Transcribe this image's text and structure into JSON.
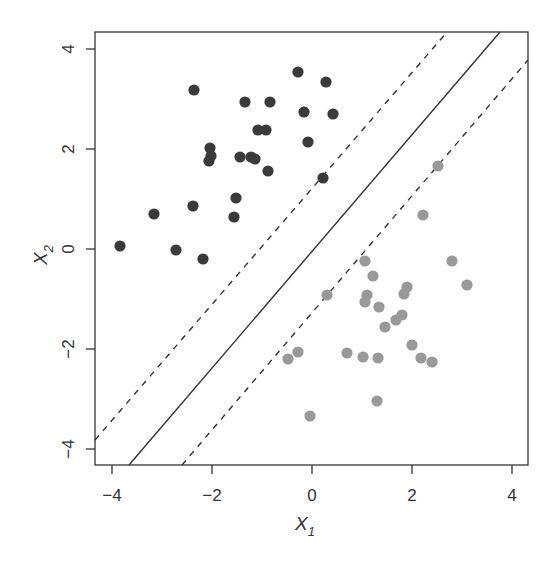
{
  "chart_data": {
    "type": "scatter",
    "title": "",
    "xlabel": "X1",
    "ylabel": "X2",
    "xlim": [
      -4.34,
      4.32
    ],
    "ylim": [
      -4.32,
      4.34
    ],
    "xticks": [
      -4,
      -2,
      0,
      2,
      4
    ],
    "yticks": [
      -4,
      -2,
      0,
      2,
      4
    ],
    "grid": false,
    "legend": null,
    "series": [
      {
        "name": "class 1",
        "color": "#3a3a3a",
        "points": [
          [
            -2.36,
            3.18
          ],
          [
            -0.28,
            3.54
          ],
          [
            0.28,
            3.34
          ],
          [
            -1.34,
            2.94
          ],
          [
            -0.84,
            2.94
          ],
          [
            -0.16,
            2.74
          ],
          [
            0.42,
            2.7
          ],
          [
            -1.08,
            2.38
          ],
          [
            -0.92,
            2.38
          ],
          [
            -0.08,
            2.14
          ],
          [
            -2.04,
            2.02
          ],
          [
            -2.02,
            1.86
          ],
          [
            -2.06,
            1.76
          ],
          [
            -1.44,
            1.84
          ],
          [
            -1.22,
            1.84
          ],
          [
            -1.14,
            1.8
          ],
          [
            -0.88,
            1.56
          ],
          [
            0.22,
            1.42
          ],
          [
            -3.16,
            0.7
          ],
          [
            -2.38,
            0.86
          ],
          [
            -1.52,
            1.02
          ],
          [
            -1.56,
            0.64
          ],
          [
            -3.84,
            0.06
          ],
          [
            -2.72,
            -0.02
          ],
          [
            -2.18,
            -0.2
          ]
        ]
      },
      {
        "name": "class 2",
        "color": "#999999",
        "points": [
          [
            2.52,
            1.66
          ],
          [
            2.22,
            0.68
          ],
          [
            1.06,
            -0.24
          ],
          [
            2.8,
            -0.24
          ],
          [
            1.22,
            -0.54
          ],
          [
            3.1,
            -0.72
          ],
          [
            1.9,
            -0.76
          ],
          [
            1.84,
            -0.9
          ],
          [
            0.3,
            -0.92
          ],
          [
            1.1,
            -0.92
          ],
          [
            1.06,
            -1.06
          ],
          [
            1.34,
            -1.16
          ],
          [
            1.8,
            -1.32
          ],
          [
            1.68,
            -1.42
          ],
          [
            1.46,
            -1.56
          ],
          [
            2.0,
            -1.92
          ],
          [
            -0.28,
            -2.06
          ],
          [
            -0.48,
            -2.2
          ],
          [
            0.7,
            -2.08
          ],
          [
            1.02,
            -2.16
          ],
          [
            1.32,
            -2.18
          ],
          [
            2.18,
            -2.18
          ],
          [
            2.4,
            -2.26
          ],
          [
            1.3,
            -3.04
          ],
          [
            -0.04,
            -3.34
          ]
        ]
      }
    ],
    "lines": [
      {
        "name": "maximal margin hyperplane",
        "style": "solid",
        "from": [
          -3.66,
          -4.32
        ],
        "to": [
          3.76,
          4.34
        ]
      },
      {
        "name": "upper margin",
        "style": "dashed",
        "from": [
          -4.34,
          -3.82
        ],
        "to": [
          2.7,
          4.34
        ]
      },
      {
        "name": "lower margin",
        "style": "dashed",
        "from": [
          -2.6,
          -4.32
        ],
        "to": [
          4.32,
          3.78
        ]
      }
    ]
  }
}
